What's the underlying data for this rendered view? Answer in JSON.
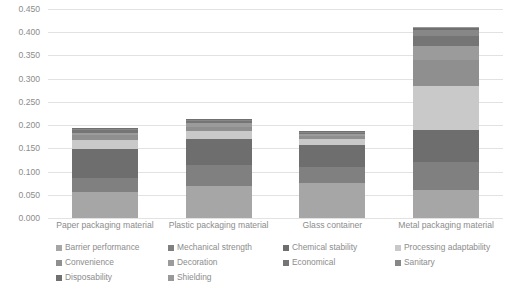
{
  "chart_data": {
    "type": "bar",
    "subtype": "stacked-column",
    "title": "",
    "xlabel": "",
    "ylabel": "",
    "ylim": [
      0,
      0.45
    ],
    "ytick_interval": 0.05,
    "ytick_labels": [
      "0.000",
      "0.050",
      "0.100",
      "0.150",
      "0.200",
      "0.250",
      "0.300",
      "0.350",
      "0.400",
      "0.450"
    ],
    "ytick_values": [
      0,
      0.05,
      0.1,
      0.15,
      0.2,
      0.25,
      0.3,
      0.35,
      0.4,
      0.45
    ],
    "grid": true,
    "legend_position": "bottom",
    "categories": [
      "Paper packaging material",
      "Plastic packaging material",
      "Glass container",
      "Metal packaging material"
    ],
    "series": [
      {
        "name": "Barrier performance",
        "color": "#a6a6a6",
        "values": [
          0.056,
          0.07,
          0.075,
          0.06
        ]
      },
      {
        "name": "Mechanical strength",
        "color": "#808080",
        "values": [
          0.03,
          0.045,
          0.035,
          0.06
        ]
      },
      {
        "name": "Chemical stability",
        "color": "#6e6e6e",
        "values": [
          0.062,
          0.055,
          0.048,
          0.07
        ]
      },
      {
        "name": "Processing adaptability",
        "color": "#c9c9c9",
        "values": [
          0.02,
          0.018,
          0.012,
          0.095
        ]
      },
      {
        "name": "Convenience",
        "color": "#8f8f8f",
        "values": [
          0.01,
          0.009,
          0.006,
          0.055
        ]
      },
      {
        "name": "Decoration",
        "color": "#9b9b9b",
        "values": [
          0.006,
          0.007,
          0.004,
          0.03
        ]
      },
      {
        "name": "Economical",
        "color": "#757575",
        "values": [
          0.005,
          0.005,
          0.004,
          0.022
        ]
      },
      {
        "name": "Sanitary",
        "color": "#878787",
        "values": [
          0.003,
          0.003,
          0.002,
          0.012
        ]
      },
      {
        "name": "Disposability",
        "color": "#707070",
        "values": [
          0.001,
          0.001,
          0.001,
          0.005
        ]
      },
      {
        "name": "Shielding",
        "color": "#999999",
        "values": [
          0.001,
          0.001,
          0.001,
          0.003
        ]
      }
    ],
    "totals": [
      0.194,
      0.214,
      0.188,
      0.412
    ]
  },
  "legend": {
    "rows": [
      [
        "Barrier performance",
        "Mechanical strength",
        "Chemical stability",
        "Processing adaptability"
      ],
      [
        "Convenience",
        "Decoration",
        "Economical",
        "Sanitary"
      ],
      [
        "Disposability",
        "Shielding"
      ]
    ]
  }
}
